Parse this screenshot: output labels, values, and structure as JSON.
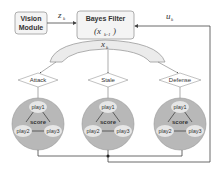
{
  "vision_module": {
    "line1": "Vision",
    "line2": "Module"
  },
  "bayes_filter": {
    "title": "Bayes Filter",
    "state": "(x",
    "state_sub": "k-1",
    "state_close": ")"
  },
  "signals": {
    "observation": "z",
    "observation_sub": "k",
    "control": "u",
    "control_sub": "k",
    "state": "x",
    "state_sub": "k"
  },
  "modes": [
    {
      "label": "Attack",
      "plays": [
        "play1",
        "play2",
        "play3"
      ],
      "center": "score"
    },
    {
      "label": "Stale",
      "plays": [
        "play1",
        "play2",
        "play3"
      ],
      "center": "score"
    },
    {
      "label": "Defense",
      "plays": [
        "play1",
        "play2",
        "play3"
      ],
      "center": "score"
    }
  ],
  "colors": {
    "box_fill": "#f4f4f4",
    "box_stroke": "#9a9a9a",
    "arc_fill": "#ebebeb",
    "circle_fill": "#b8b8b8",
    "node_fill": "#e6e6e6",
    "line": "#444444"
  }
}
